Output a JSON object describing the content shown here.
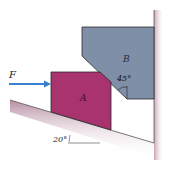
{
  "diagram": {
    "force_label": "F",
    "block_a_label": "A",
    "block_b_label": "B",
    "wedge_angle_label": "45°",
    "incline_angle_label": "20°",
    "colors": {
      "block_a": "#a8336f",
      "block_b": "#7f8fa8",
      "arrow": "#3a7fd0",
      "ground_shade": "#c9a3b5",
      "outline": "#2a2a2a"
    }
  }
}
